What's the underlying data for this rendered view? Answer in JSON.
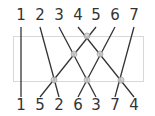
{
  "diagram": {
    "type": "permutation-wiring",
    "colors": {
      "wire": "#333333",
      "box": "#d8d8d8",
      "node_fill": "#d0d0d0",
      "node_stroke": "#999999",
      "text": "#333333"
    },
    "top_labels": [
      "1",
      "2",
      "3",
      "4",
      "5",
      "6",
      "7"
    ],
    "bottom_labels": [
      "1",
      "5",
      "2",
      "6",
      "3",
      "7",
      "4"
    ],
    "label_x": [
      21,
      40,
      59,
      78,
      96,
      115,
      134
    ],
    "top_label_y": 20,
    "bottom_label_y": 110,
    "wire_top_y": 27,
    "wire_bottom_y": 97,
    "box": {
      "x": 13,
      "y": 36,
      "width": 130,
      "height": 45
    },
    "wires": [
      {
        "from": "1",
        "to": "1",
        "x1": 21,
        "x2": 21
      },
      {
        "from": "2",
        "to": "2",
        "x1": 40,
        "x2": 59
      },
      {
        "from": "3",
        "to": "3",
        "x1": 59,
        "x2": 96
      },
      {
        "from": "4",
        "to": "4",
        "x1": 78,
        "x2": 134
      },
      {
        "from": "5",
        "to": "5",
        "x1": 96,
        "x2": 40
      },
      {
        "from": "6",
        "to": "6",
        "x1": 115,
        "x2": 78
      },
      {
        "from": "7",
        "to": "7",
        "x1": 134,
        "x2": 115
      }
    ],
    "crossings": [
      {
        "x": 87,
        "y": 36
      },
      {
        "x": 74,
        "y": 54
      },
      {
        "x": 100,
        "y": 54
      },
      {
        "x": 54,
        "y": 80
      },
      {
        "x": 87,
        "y": 80
      },
      {
        "x": 121,
        "y": 80
      }
    ]
  }
}
